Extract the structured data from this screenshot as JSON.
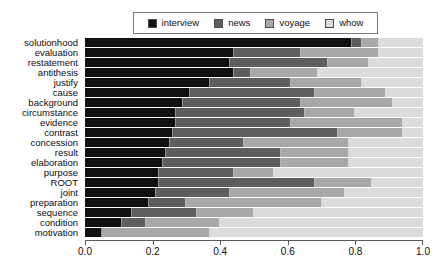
{
  "chart_data": {
    "type": "bar",
    "orientation": "horizontal",
    "stacked": true,
    "normalized": true,
    "title": "",
    "subtitle": "",
    "xlabel": "",
    "ylabel": "",
    "xlim": [
      0.0,
      1.0
    ],
    "grid": false,
    "legend_position": "top",
    "legend": [
      "interview",
      "news",
      "voyage",
      "whow"
    ],
    "xticks": [
      0.0,
      0.2,
      0.4,
      0.6,
      0.8,
      1.0
    ],
    "xticklabels": [
      "0.0",
      "0.2",
      "0.4",
      "0.6",
      "0.8",
      "1.0"
    ],
    "categories": [
      "solutionhood",
      "evaluation",
      "restatement",
      "antithesis",
      "justify",
      "cause",
      "background",
      "circumstance",
      "evidence",
      "contrast",
      "concession",
      "result",
      "elaboration",
      "purpose",
      "ROOT",
      "joint",
      "preparation",
      "sequence",
      "condition",
      "motivation"
    ],
    "series": [
      {
        "name": "interview",
        "color": "#111111",
        "values": [
          0.79,
          0.44,
          0.43,
          0.44,
          0.37,
          0.31,
          0.29,
          0.27,
          0.27,
          0.26,
          0.25,
          0.24,
          0.23,
          0.22,
          0.22,
          0.21,
          0.19,
          0.14,
          0.11,
          0.05
        ]
      },
      {
        "name": "news",
        "color": "#5e5e5e",
        "values": [
          0.03,
          0.2,
          0.29,
          0.05,
          0.24,
          0.37,
          0.35,
          0.38,
          0.34,
          0.49,
          0.22,
          0.34,
          0.35,
          0.22,
          0.46,
          0.22,
          0.11,
          0.19,
          0.07,
          0.0
        ]
      },
      {
        "name": "voyage",
        "color": "#a8a8a8",
        "values": [
          0.05,
          0.23,
          0.12,
          0.2,
          0.21,
          0.21,
          0.27,
          0.15,
          0.33,
          0.19,
          0.31,
          0.2,
          0.2,
          0.12,
          0.17,
          0.34,
          0.4,
          0.17,
          0.22,
          0.32
        ]
      },
      {
        "name": "whow",
        "color": "#dcdcdc",
        "values": [
          0.13,
          0.13,
          0.16,
          0.31,
          0.18,
          0.11,
          0.09,
          0.2,
          0.06,
          0.06,
          0.22,
          0.22,
          0.22,
          0.44,
          0.15,
          0.23,
          0.3,
          0.5,
          0.6,
          0.63
        ]
      }
    ]
  }
}
